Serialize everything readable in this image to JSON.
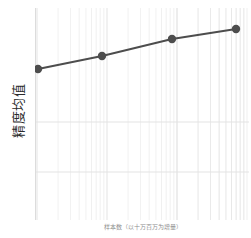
{
  "chart": {
    "ylabel": "精度均值",
    "xlabel": "样本数（以十万百万为增量）",
    "line_color": "#4d4d4d",
    "marker_color": "#4d4d4d",
    "grid_color": "#e3e3e3",
    "background": "#ffffff"
  },
  "chart_data": {
    "type": "line",
    "title": "",
    "xlabel": "样本数（以十万百万为增量）",
    "ylabel": "精度均值",
    "xscale": "log",
    "yscale": "linear",
    "grid": true,
    "legend": "none",
    "xlim": [
      1,
      1000
    ],
    "ylim": [
      0,
      1
    ],
    "x": [
      1,
      10,
      100,
      1000
    ],
    "series": [
      {
        "name": "精度均值",
        "values": [
          0.71,
          0.77,
          0.85,
          0.89
        ],
        "marker": "circle",
        "color": "#4d4d4d"
      }
    ],
    "points": [
      {
        "x": 1,
        "y": 0.71,
        "px": 38,
        "py": 69
      },
      {
        "x": 10,
        "y": 0.77,
        "px": 102,
        "py": 56
      },
      {
        "x": 100,
        "y": 0.85,
        "px": 172,
        "py": 39
      },
      {
        "x": 1000,
        "y": 0.89,
        "px": 236,
        "py": 29
      }
    ],
    "xticks": [],
    "yticks": [],
    "annotations": []
  }
}
